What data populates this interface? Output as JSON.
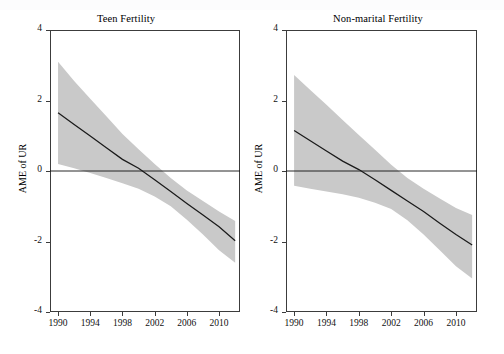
{
  "figure": {
    "panels": [
      {
        "key": "teen",
        "title": "Teen Fertility",
        "ylabel": "AME of UR"
      },
      {
        "key": "nonmarital",
        "title": "Non-marital Fertility",
        "ylabel": "AME of UR"
      }
    ]
  },
  "chart_data": [
    {
      "type": "line",
      "title": "Teen Fertility",
      "xlabel": "",
      "ylabel": "AME of UR",
      "xlim": [
        1989.0,
        2012.6
      ],
      "ylim": [
        -4,
        4
      ],
      "xticks": [
        1990,
        1994,
        1998,
        2002,
        2006,
        2010
      ],
      "yticks": [
        4,
        2,
        0,
        -2,
        -4
      ],
      "grid": false,
      "legend": "none",
      "zero_reference_line": 0,
      "zero_crossing_x": 2000.5,
      "series": [
        {
          "name": "AME of UR",
          "x": [
            1990,
            1992,
            1994,
            1996,
            1998,
            2000,
            2002,
            2004,
            2006,
            2008,
            2010,
            2012
          ],
          "values": [
            1.65,
            1.32,
            0.99,
            0.66,
            0.33,
            0.08,
            -0.25,
            -0.58,
            -0.92,
            -1.25,
            -1.58,
            -1.98
          ]
        },
        {
          "name": "95% CI upper",
          "x": [
            1990,
            1992,
            1994,
            1996,
            1998,
            2000,
            2002,
            2004,
            2006,
            2008,
            2010,
            2012
          ],
          "values": [
            3.1,
            2.55,
            2.05,
            1.55,
            1.05,
            0.62,
            0.2,
            -0.2,
            -0.55,
            -0.85,
            -1.15,
            -1.42
          ]
        },
        {
          "name": "95% CI lower",
          "x": [
            1990,
            1992,
            1994,
            1996,
            1998,
            2000,
            2002,
            2004,
            2006,
            2008,
            2010,
            2012
          ],
          "values": [
            0.2,
            0.08,
            -0.06,
            -0.2,
            -0.35,
            -0.5,
            -0.72,
            -1.0,
            -1.38,
            -1.8,
            -2.25,
            -2.6
          ]
        }
      ]
    },
    {
      "type": "line",
      "title": "Non-marital Fertility",
      "xlabel": "",
      "ylabel": "AME of UR",
      "xlim": [
        1989.0,
        2012.6
      ],
      "ylim": [
        -4,
        4
      ],
      "xticks": [
        1990,
        1994,
        1998,
        2002,
        2006,
        2010
      ],
      "yticks": [
        4,
        2,
        0,
        -2,
        -4
      ],
      "grid": false,
      "legend": "none",
      "zero_reference_line": 0,
      "zero_crossing_x": 1998.3,
      "series": [
        {
          "name": "AME of UR",
          "x": [
            1990,
            1992,
            1994,
            1996,
            1998,
            2000,
            2002,
            2004,
            2006,
            2008,
            2010,
            2012
          ],
          "values": [
            1.15,
            0.86,
            0.57,
            0.28,
            0.04,
            -0.25,
            -0.55,
            -0.85,
            -1.15,
            -1.48,
            -1.8,
            -2.1
          ]
        },
        {
          "name": "95% CI upper",
          "x": [
            1990,
            1992,
            1994,
            1996,
            1998,
            2000,
            2002,
            2004,
            2006,
            2008,
            2010,
            2012
          ],
          "values": [
            2.72,
            2.3,
            1.88,
            1.45,
            1.02,
            0.6,
            0.18,
            -0.2,
            -0.5,
            -0.78,
            -1.05,
            -1.25
          ]
        },
        {
          "name": "95% CI lower",
          "x": [
            1990,
            1992,
            1994,
            1996,
            1998,
            2000,
            2002,
            2004,
            2006,
            2008,
            2010,
            2012
          ],
          "values": [
            -0.42,
            -0.5,
            -0.58,
            -0.66,
            -0.76,
            -0.9,
            -1.08,
            -1.4,
            -1.8,
            -2.25,
            -2.7,
            -3.05
          ]
        }
      ]
    }
  ]
}
